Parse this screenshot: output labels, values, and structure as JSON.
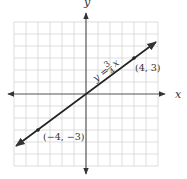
{
  "figure": {
    "x_axis_label": "x",
    "y_axis_label": "y",
    "equation": {
      "lhs": "y =",
      "numerator": "3",
      "denominator": "4",
      "var": "x"
    },
    "points": [
      {
        "label": "(4, 3)",
        "x": 4,
        "y": 3
      },
      {
        "label": "(−4, −3)",
        "x": -4,
        "y": -3
      }
    ],
    "grid_range": {
      "xmin": -6,
      "xmax": 6,
      "ymin": -6,
      "ymax": 6
    },
    "colors": {
      "grid": "#cccccc",
      "axis": "#555555",
      "line": "#222222"
    }
  }
}
